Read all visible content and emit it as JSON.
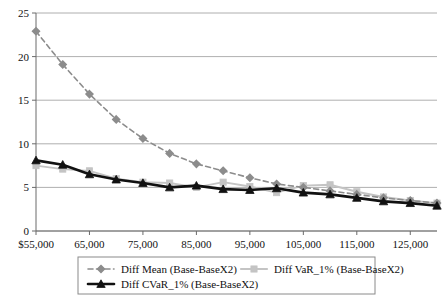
{
  "chart_data": {
    "type": "line",
    "title": "",
    "xlabel": "",
    "ylabel": "",
    "ylim": [
      0,
      25
    ],
    "xlim": [
      55000,
      130000
    ],
    "grid": true,
    "legend_position": "bottom",
    "y_ticks": [
      "0",
      "5",
      "10",
      "15",
      "20",
      "25"
    ],
    "y_tick_values": [
      0,
      5,
      10,
      15,
      20,
      25
    ],
    "x_ticks": [
      "$55,000",
      "65,000",
      "75,000",
      "85,000",
      "95,000",
      "105,000",
      "115,000",
      "125,000"
    ],
    "x_tick_values": [
      55000,
      65000,
      75000,
      85000,
      95000,
      105000,
      115000,
      125000
    ],
    "x": [
      55000,
      60000,
      65000,
      70000,
      75000,
      80000,
      85000,
      90000,
      95000,
      100000,
      105000,
      110000,
      115000,
      120000,
      125000,
      130000
    ],
    "series": [
      {
        "name": "Diff Mean (Base-BaseX2)",
        "color": "#8c8c8c",
        "style": "dashed",
        "marker": "diamond",
        "values": [
          22.9,
          19.1,
          15.7,
          12.8,
          10.6,
          8.9,
          7.7,
          6.9,
          6.1,
          5.4,
          5.0,
          4.6,
          4.2,
          3.8,
          3.5,
          3.2
        ]
      },
      {
        "name": "Diff VaR_1% (Base-BaseX2)",
        "color": "#c4c4c4",
        "style": "solid",
        "marker": "square",
        "values": [
          7.5,
          7.1,
          6.9,
          6.0,
          5.6,
          5.5,
          5.0,
          5.6,
          5.1,
          4.4,
          5.2,
          5.3,
          4.5,
          3.9,
          3.5,
          3.2
        ]
      },
      {
        "name": "Diff CVaR_1% (Base-BaseX2)",
        "color": "#111111",
        "style": "solid-bold",
        "marker": "triangle",
        "values": [
          8.1,
          7.6,
          6.5,
          5.9,
          5.5,
          5.0,
          5.2,
          4.8,
          4.7,
          4.9,
          4.4,
          4.2,
          3.8,
          3.4,
          3.2,
          2.9
        ]
      }
    ]
  },
  "legend": {
    "entries": [
      {
        "label": "Diff Mean (Base-BaseX2)",
        "marker": "diamond-dashed-marker"
      },
      {
        "label": "Diff VaR_1% (Base-BaseX2)",
        "marker": "square-solid-marker"
      },
      {
        "label": "Diff CVaR_1% (Base-BaseX2)",
        "marker": "triangle-bold-marker"
      }
    ]
  }
}
